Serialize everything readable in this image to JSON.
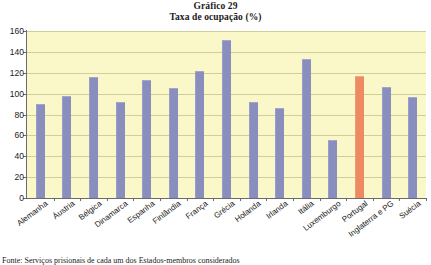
{
  "chart_data": {
    "type": "bar",
    "title": "Gráfico 29",
    "subtitle": "Taxa de ocupação (%)",
    "xlabel": "",
    "ylabel": "",
    "ylim": [
      0,
      160
    ],
    "ytick_step": 20,
    "yticks": [
      "160",
      "140",
      "120",
      "100",
      "80",
      "60",
      "40",
      "20",
      "0"
    ],
    "grid": true,
    "legend": "none",
    "categories": [
      "Alemanha",
      "Áustria",
      "Bélgica",
      "Dinamarca",
      "Espanha",
      "Finlândia",
      "França",
      "Grécia",
      "Holanda",
      "Irlanda",
      "Itália",
      "Luxemburgo",
      "Portugal",
      "Inglaterra e PG",
      "Suécia"
    ],
    "values": [
      90,
      98,
      116,
      92,
      113,
      105,
      122,
      151,
      92,
      86,
      133,
      56,
      117,
      106,
      97
    ],
    "highlight_category": "Portugal",
    "colors": {
      "bar": "#8a8ebe",
      "bar_highlight": "#ed8a63",
      "plot_background": "#faf8c8",
      "gridline": "#cfcf9a",
      "axis": "#6b6b6b",
      "text": "#1a1a1a"
    }
  },
  "source": {
    "note": "Fonte: Serviços prisionais de cada um dos Estados-membros considerados"
  }
}
